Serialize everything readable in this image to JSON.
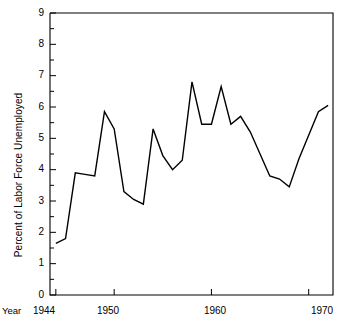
{
  "chart_data": {
    "type": "line",
    "title": "",
    "xlabel": "Year",
    "ylabel": "Percent of Labor Force Unemployed",
    "xlim": [
      1943.4,
      1972.5
    ],
    "ylim": [
      0,
      9
    ],
    "grid": false,
    "legend": null,
    "x_tick_labels": [
      "1944",
      "1950",
      "1960",
      "1970"
    ],
    "x_tick_values": [
      1944,
      1950,
      1960,
      1970
    ],
    "x_minor_ticks": false,
    "y_tick_labels": [
      "0",
      "1",
      "2",
      "3",
      "4",
      "5",
      "6",
      "7",
      "8",
      "9"
    ],
    "y_tick_values": [
      0,
      1,
      2,
      3,
      4,
      5,
      6,
      7,
      8,
      9
    ],
    "y_minor_tick_values": [
      0.5,
      1.5,
      2.5,
      3.5,
      4.5,
      5.5,
      6.5,
      7.5,
      8.5
    ],
    "line_color": "#000000",
    "line_width": 1.4,
    "x": [
      1944,
      1945,
      1946,
      1947,
      1948,
      1949,
      1950,
      1951,
      1952,
      1953,
      1954,
      1955,
      1956,
      1957,
      1958,
      1959,
      1960,
      1961,
      1962,
      1963,
      1964,
      1965,
      1966,
      1967,
      1968,
      1969,
      1970,
      1971,
      1972
    ],
    "values": [
      1.65,
      1.8,
      3.9,
      3.85,
      3.8,
      5.85,
      5.3,
      3.3,
      3.05,
      2.9,
      5.3,
      4.45,
      4.0,
      4.3,
      6.8,
      5.45,
      5.45,
      6.65,
      5.45,
      5.7,
      5.2,
      4.5,
      3.8,
      3.7,
      3.45,
      4.35,
      5.1,
      5.85,
      6.05
    ],
    "series": [
      {
        "name": "Percent of Labor Force Unemployed",
        "values": [
          1.65,
          1.8,
          3.9,
          3.85,
          3.8,
          5.85,
          5.3,
          3.3,
          3.05,
          2.9,
          5.3,
          4.45,
          4.0,
          4.3,
          6.8,
          5.45,
          5.45,
          6.65,
          5.45,
          5.7,
          5.2,
          4.5,
          3.8,
          3.7,
          3.45,
          4.35,
          5.1,
          5.85,
          6.05
        ]
      }
    ]
  },
  "axes": {
    "y_title": "Percent of Labor Force Unemployed",
    "x_title": "Year",
    "y_labels": [
      "9",
      "8",
      "7",
      "6",
      "5",
      "4",
      "3",
      "2",
      "1",
      "0"
    ],
    "x_labels": [
      "1944",
      "1950",
      "1960",
      "1970"
    ]
  },
  "style": {
    "background": "#ffffff",
    "ink": "#000000"
  }
}
